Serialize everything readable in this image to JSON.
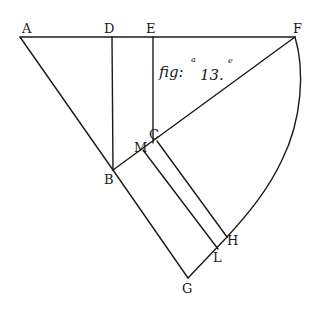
{
  "figure": {
    "caption": "fig:",
    "caption_sup": "a",
    "number": "13.",
    "number_sup": "e"
  },
  "labels": {
    "A": "A",
    "D": "D",
    "E": "E",
    "F": "F",
    "B": "B",
    "C": "C",
    "M": "M",
    "H": "H",
    "L": "L",
    "G": "G"
  },
  "colors": {
    "ink": "#1a1a1a",
    "paper": "#ffffff"
  }
}
